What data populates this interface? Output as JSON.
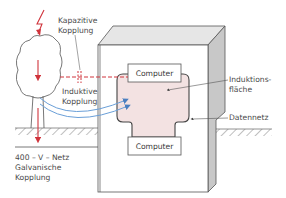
{
  "diagram": {
    "type": "coupling-paths-illustration",
    "labels": {
      "capacitive_line1": "Kapazitive",
      "capacitive_line2": "Kopplung",
      "inductive_line1": "Induktive",
      "inductive_line2": "Kopplung",
      "induction_area_line1": "Induktions-",
      "induction_area_line2": "fläche",
      "data_network": "Datennetz",
      "galvanic_line1": "400 – V – Netz",
      "galvanic_line2": "Galvanische",
      "galvanic_line3": "Kopplung"
    },
    "boxes": {
      "computer_top": "Computer",
      "computer_bottom": "Computer"
    },
    "elements": [
      {
        "name": "lightning",
        "color": "#e0303a"
      },
      {
        "name": "tree",
        "color": "#555555"
      },
      {
        "name": "building",
        "front": "#ffffff",
        "side": "#c8c8c8",
        "top": "#e6e6e6"
      },
      {
        "name": "induction-area",
        "fill": "#f3e2e2"
      },
      {
        "name": "capacitive-coupling-line",
        "color": "#d0343c",
        "style": "dashed"
      },
      {
        "name": "inductive-coupling-arcs",
        "color": "#6a9fd8"
      },
      {
        "name": "ground",
        "color": "#777777",
        "style": "hatched"
      }
    ],
    "colors": {
      "accent_red": "#d0343c",
      "accent_blue": "#6a9fd8",
      "line": "#555555",
      "induction_fill": "#f3e2e2",
      "wall_side": "#c8c8c8",
      "wall_top": "#e6e6e6"
    }
  }
}
